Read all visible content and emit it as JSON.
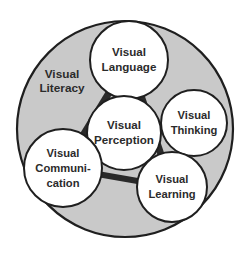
{
  "diagram": {
    "title": "Visual Literacy",
    "type": "concept-network",
    "outer": {
      "label": "Visual Literacy",
      "label_lines": [
        "Visual",
        "Literacy"
      ],
      "fill_color": "#c9c9c9",
      "stroke_color": "#1f1f1f",
      "cx": 125,
      "cy": 129,
      "r": 108
    },
    "background_color": "#ffffff",
    "node_fill_color": "#ffffff",
    "node_stroke_color": "#1f1f1f",
    "connector_color": "#2a2a2a",
    "node_marker_color": "#6e6e6e",
    "nodes": [
      {
        "id": "visual-language",
        "label": "Visual Language",
        "label_lines": [
          "Visual",
          "Language"
        ],
        "cx": 129,
        "cy": 60,
        "r": 39
      },
      {
        "id": "visual-thinking",
        "label": "Visual Thinking",
        "label_lines": [
          "Visual",
          "Thinking"
        ],
        "cx": 194,
        "cy": 123,
        "r": 33
      },
      {
        "id": "visual-perception",
        "label": "Visual Perception",
        "label_lines": [
          "Visual",
          "Perception"
        ],
        "cx": 124,
        "cy": 133,
        "r": 37
      },
      {
        "id": "visual-communication",
        "label": "Visual Communication",
        "label_lines": [
          "Visual",
          "Communi-",
          "cation"
        ],
        "cx": 63,
        "cy": 168,
        "r": 39
      },
      {
        "id": "visual-learning",
        "label": "Visual Learning",
        "label_lines": [
          "Visual",
          "Learning"
        ],
        "cx": 172,
        "cy": 187,
        "r": 35
      }
    ],
    "connectors": [
      {
        "id": "language-perception",
        "from": "visual-language",
        "to": "visual-perception",
        "weight": "thick"
      },
      {
        "id": "language-communication",
        "from": "visual-language",
        "to": "visual-communication",
        "weight": "thick"
      },
      {
        "id": "language-learning",
        "from": "visual-language",
        "to": "visual-learning",
        "weight": "thick"
      },
      {
        "id": "perception-thinking",
        "from": "visual-perception",
        "to": "visual-thinking",
        "weight": "thick"
      },
      {
        "id": "perception-communication",
        "from": "visual-perception",
        "to": "visual-communication",
        "weight": "thick"
      },
      {
        "id": "perception-learning",
        "from": "visual-perception",
        "to": "visual-learning",
        "weight": "medium"
      },
      {
        "id": "thinking-learning",
        "from": "visual-thinking",
        "to": "visual-learning",
        "weight": "medium"
      },
      {
        "id": "communication-learning",
        "from": "visual-communication",
        "to": "visual-learning",
        "weight": "thick"
      }
    ]
  }
}
